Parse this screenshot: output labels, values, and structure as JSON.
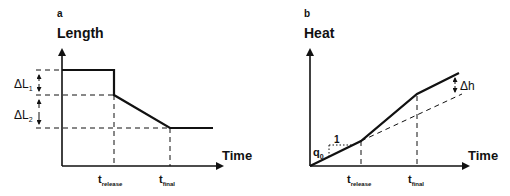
{
  "panels": [
    {
      "id": "a",
      "panel_label": "a",
      "y_axis_label": "Length",
      "x_axis_label": "Time",
      "annotations": {
        "delta1_main": "ΔL",
        "delta1_sub": "1",
        "delta2_main": "ΔL",
        "delta2_sub": "2",
        "t1_main": "t",
        "t1_sub": "release",
        "t2_main": "t",
        "t2_sub": "final"
      }
    },
    {
      "id": "b",
      "panel_label": "b",
      "y_axis_label": "Heat",
      "x_axis_label": "Time",
      "annotations": {
        "slope_main": "q",
        "slope_sub": "0",
        "slope_run": "1",
        "delta_h": "Δh",
        "t1_main": "t",
        "t1_sub": "release",
        "t2_main": "t",
        "t2_sub": "final"
      }
    }
  ],
  "colors": {
    "line": "#111111",
    "background": "#ffffff"
  }
}
